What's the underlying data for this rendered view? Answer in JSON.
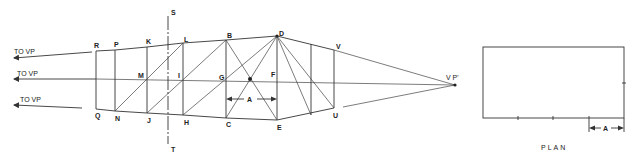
{
  "diagram": {
    "colors": {
      "line": "#333333",
      "text": "#222222",
      "background": "#ffffff"
    },
    "arrows_to_vp": [
      {
        "label": "TO VP",
        "x1": 92,
        "y1": 52,
        "x2": 14,
        "y2": 58,
        "lx": 14,
        "ly": 54
      },
      {
        "label": "TO VP",
        "x1": 96,
        "y1": 79,
        "x2": 14,
        "y2": 79,
        "lx": 17,
        "ly": 76
      },
      {
        "label": "TO VP",
        "x1": 82,
        "y1": 108,
        "x2": 14,
        "y2": 105,
        "lx": 20,
        "ly": 102
      }
    ],
    "points": {
      "R": {
        "label": "R",
        "x": 96,
        "y": 51,
        "lx": 96,
        "ly": 49
      },
      "P": {
        "label": "P",
        "x": 115,
        "y": 50,
        "lx": 116,
        "ly": 47
      },
      "K": {
        "label": "K",
        "x": 147,
        "y": 47,
        "lx": 148,
        "ly": 44
      },
      "L": {
        "label": "L",
        "x": 183,
        "y": 43,
        "lx": 184,
        "ly": 41
      },
      "B": {
        "label": "B",
        "x": 226,
        "y": 40,
        "lx": 228,
        "ly": 37
      },
      "D": {
        "label": "D",
        "x": 277,
        "y": 36,
        "lx": 279,
        "ly": 35
      },
      "V": {
        "label": "V",
        "x": 334,
        "y": 50,
        "lx": 336,
        "ly": 49
      },
      "M": {
        "label": "M",
        "x": 147,
        "y": 79,
        "lx": 138,
        "ly": 78
      },
      "I": {
        "label": "I",
        "x": 183,
        "y": 79,
        "lx": 178,
        "ly": 78
      },
      "G": {
        "label": "G",
        "x": 226,
        "y": 79,
        "lx": 219,
        "ly": 80
      },
      "O": {
        "label": "",
        "x": 250,
        "y": 79
      },
      "F": {
        "label": "F",
        "x": 277,
        "y": 79,
        "lx": 272,
        "ly": 77
      },
      "Q": {
        "label": "Q",
        "x": 96,
        "y": 109,
        "lx": 96,
        "ly": 118
      },
      "N": {
        "label": "N",
        "x": 115,
        "y": 111,
        "lx": 116,
        "ly": 120
      },
      "J": {
        "label": "J",
        "x": 147,
        "y": 113,
        "lx": 148,
        "ly": 122
      },
      "H": {
        "label": "H",
        "x": 183,
        "y": 115,
        "lx": 184,
        "ly": 124
      },
      "C": {
        "label": "C",
        "x": 226,
        "y": 118,
        "lx": 227,
        "ly": 127
      },
      "E": {
        "label": "E",
        "x": 277,
        "y": 120,
        "lx": 278,
        "ly": 129
      },
      "U": {
        "label": "U",
        "x": 334,
        "y": 108,
        "lx": 335,
        "ly": 117
      },
      "VP2": {
        "label": "V P'",
        "x": 455,
        "y": 85,
        "lx": 446,
        "ly": 80
      }
    },
    "picture_plane": {
      "top_label": "S",
      "bottom_label": "T",
      "x": 168,
      "y1": 16,
      "y2": 144
    },
    "measure_a": {
      "label": "A",
      "x1": 226,
      "x2": 277,
      "y": 99
    },
    "plan": {
      "label": "PLAN",
      "x": 483,
      "y": 47,
      "w": 141,
      "h": 71,
      "bottom_ticks": [
        518,
        553,
        589
      ],
      "right_tick_y": 83,
      "dim_label": "A",
      "dim_x1": 589,
      "dim_x2": 624,
      "dim_y": 128
    }
  }
}
